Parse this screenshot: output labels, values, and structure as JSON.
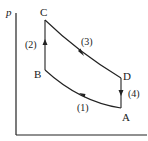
{
  "diagram": {
    "type": "p-V thermodynamic cycle",
    "axes": {
      "y_label": "p",
      "x_label": ""
    },
    "points": [
      {
        "name": "A",
        "label": "A"
      },
      {
        "name": "B",
        "label": "B"
      },
      {
        "name": "C",
        "label": "C"
      },
      {
        "name": "D",
        "label": "D"
      }
    ],
    "processes": [
      {
        "id": "1",
        "label": "(1)",
        "from": "A",
        "to": "B",
        "shape": "curve"
      },
      {
        "id": "2",
        "label": "(2)",
        "from": "B",
        "to": "C",
        "shape": "vertical"
      },
      {
        "id": "3",
        "label": "(3)",
        "from": "C",
        "to": "D",
        "shape": "curve"
      },
      {
        "id": "4",
        "label": "(4)",
        "from": "D",
        "to": "A",
        "shape": "vertical"
      }
    ],
    "colors": {
      "line": "#222222",
      "background": "#ffffff"
    }
  }
}
